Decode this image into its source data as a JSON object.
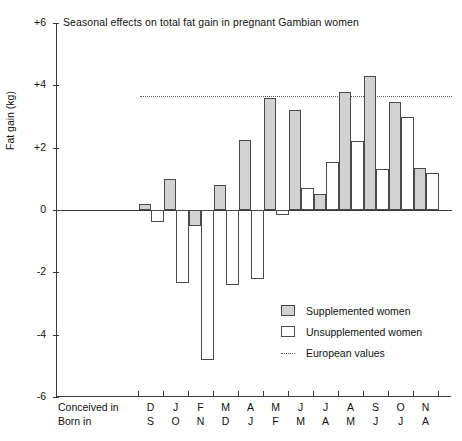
{
  "chart_data": {
    "type": "bar",
    "title": "Seasonal effects on total fat gain in pregnant Gambian women",
    "xlabel": "",
    "ylabel": "Fat gain (kg)",
    "ylim": [
      -6,
      6
    ],
    "yticks": [
      "+6",
      "+4",
      "+2",
      "0",
      "-2",
      "-4",
      "-6"
    ],
    "ytick_values": [
      6,
      4,
      2,
      0,
      -2,
      -4,
      -6
    ],
    "grid": false,
    "legend_position": "lower-right",
    "categories": [
      "D",
      "J",
      "F",
      "M",
      "A",
      "M",
      "J",
      "J",
      "A",
      "S",
      "O",
      "N"
    ],
    "categories_secondary": [
      "S",
      "O",
      "N",
      "D",
      "J",
      "F",
      "M",
      "A",
      "M",
      "J",
      "J",
      "A"
    ],
    "row_label_primary": "Conceived in",
    "row_label_secondary": "Born in",
    "series": [
      {
        "name": "Supplemented women",
        "color": "#d2d2d2",
        "values": [
          0.2,
          1.0,
          -0.5,
          0.8,
          2.25,
          3.6,
          3.2,
          0.5,
          3.8,
          4.3,
          3.45,
          1.35
        ]
      },
      {
        "name": "Unsupplemented women",
        "color": "#ffffff",
        "values": [
          -0.4,
          -2.35,
          -4.8,
          -2.4,
          -2.2,
          -0.15,
          0.7,
          1.55,
          2.2,
          1.3,
          3.0,
          1.2
        ]
      }
    ],
    "reference_line": {
      "name": "European values",
      "value": 3.65,
      "style": "dotted",
      "color": "#555555"
    }
  },
  "legend": {
    "items": [
      {
        "label": "Supplemented women",
        "swatch": "filled-gray"
      },
      {
        "label": "Unsupplemented women",
        "swatch": "outline-white"
      },
      {
        "label": "European values",
        "swatch": "dotted-line"
      }
    ]
  }
}
